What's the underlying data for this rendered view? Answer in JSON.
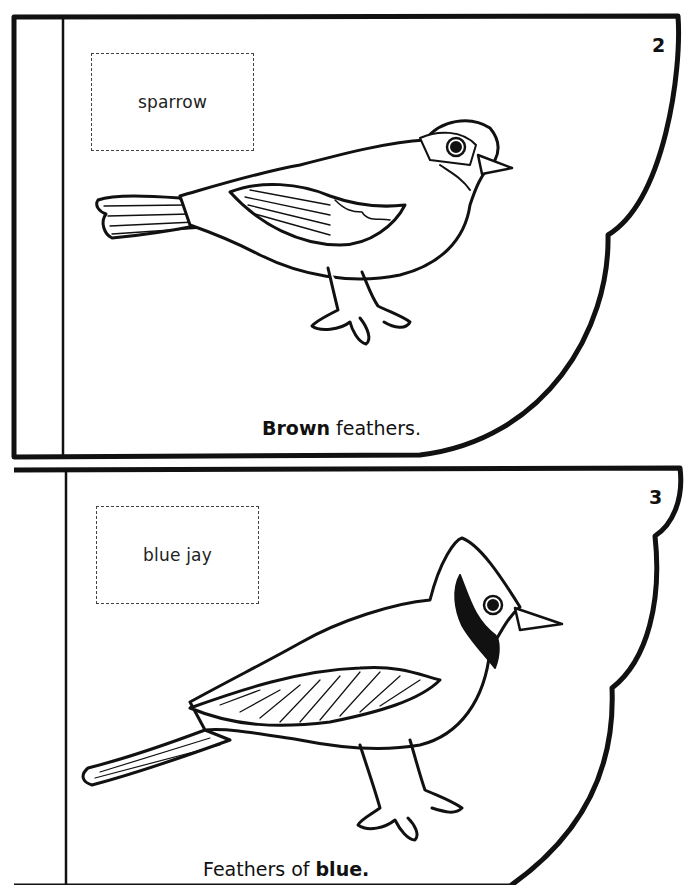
{
  "pages": [
    {
      "number": "2",
      "label": "sparrow",
      "caption": {
        "bold": "Brown",
        "rest": " feathers."
      },
      "illustration": "sparrow-line-art"
    },
    {
      "number": "3",
      "label": "blue jay",
      "caption": {
        "prefix": "Feathers of ",
        "bold": "blue."
      },
      "illustration": "blue-jay-line-art"
    }
  ],
  "colors": {
    "ink": "#111111",
    "paper": "#ffffff",
    "dash": "#444444"
  }
}
